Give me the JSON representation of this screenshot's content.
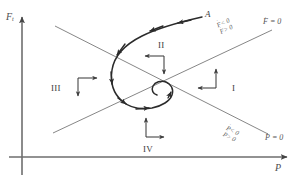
{
  "figure": {
    "type": "phase-plane-diagram",
    "background_color": "#ffffff",
    "line_color": "#5a5a5a",
    "trajectory_color": "#2b2b2b"
  },
  "axes": {
    "y_axis_label": "F",
    "y_axis_subscript": "t",
    "x_axis_label": "P",
    "x_axis_name": "horizontal-axis",
    "y_axis_name": "vertical-axis"
  },
  "nullclines": [
    {
      "id": "f-dot-zero",
      "label": "F = 0",
      "label_symbol": "F",
      "label_dot": "˙",
      "label_equals": "= 0",
      "slope": "ascending",
      "inequality_top": "F < 0",
      "inequality_bottom": "F > 0",
      "ineq_top_symbol": "F",
      "ineq_top_rel": "< 0",
      "ineq_bottom_symbol": "F",
      "ineq_bottom_rel": "> 0"
    },
    {
      "id": "p-dot-zero",
      "label": "P = 0",
      "label_symbol": "P",
      "label_dot": "˙",
      "label_equals": "= 0",
      "slope": "descending",
      "inequality_top": "P < 0",
      "inequality_bottom": "P > 0",
      "ineq_top_symbol": "P",
      "ineq_top_rel": "< 0",
      "ineq_bottom_symbol": "P",
      "ineq_bottom_rel": "> 0"
    }
  ],
  "regions": [
    {
      "id": "region-1",
      "label": "I",
      "arrows": [
        "up",
        "left"
      ]
    },
    {
      "id": "region-2",
      "label": "II",
      "arrows": [
        "left",
        "down"
      ]
    },
    {
      "id": "region-3",
      "label": "III",
      "arrows": [
        "right",
        "down"
      ]
    },
    {
      "id": "region-4",
      "label": "IV",
      "arrows": [
        "up",
        "right"
      ]
    }
  ],
  "trajectory": {
    "start_point_label": "A",
    "direction": "inward-spiral",
    "arrowhead_count": 7,
    "converges_to": "fixed-point-at-nullcline-intersection"
  }
}
